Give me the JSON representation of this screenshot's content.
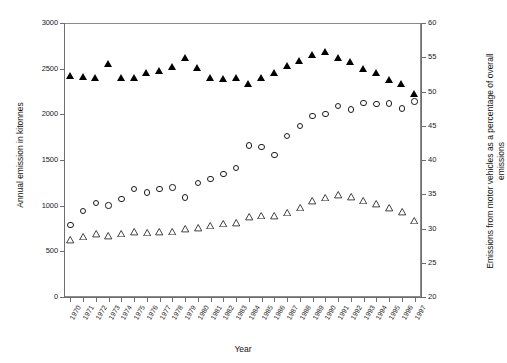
{
  "figure": {
    "title": "",
    "x_axis_title": "Year",
    "y_left_title": "Annual emission in kitonnes",
    "y_right_title": "Emissions from motor vehicles as a percentage of overall emissions"
  },
  "chart_data": {
    "type": "scatter",
    "title": "",
    "xlabel": "Year",
    "ylabel": "Annual emission in kitonnes",
    "y2label": "Emissions from motor vehicles as a percentage of overall emissions",
    "grid": false,
    "legend": "none",
    "xlim": [
      1970,
      1997
    ],
    "ylim": [
      0,
      3000
    ],
    "y2lim": [
      20,
      60
    ],
    "y_ticks": [
      0,
      500,
      1000,
      1500,
      2000,
      2500,
      3000
    ],
    "y2_ticks": [
      20,
      25,
      30,
      35,
      40,
      45,
      50,
      55,
      60
    ],
    "categories": [
      "1970",
      "1971",
      "1972",
      "1973",
      "1974",
      "1975",
      "1976",
      "1977",
      "1978",
      "1979",
      "1980",
      "1981",
      "1982",
      "1983",
      "1984",
      "1985",
      "1986",
      "1987",
      "1988",
      "1989",
      "1990",
      "1991",
      "1992",
      "1993",
      "1994",
      "1995",
      "1996",
      "1997"
    ],
    "series": [
      {
        "name": "Total annual emission (filled triangle)",
        "marker": "filled-triangle",
        "axis": "left",
        "values": [
          2420,
          2415,
          2400,
          2550,
          2395,
          2400,
          2450,
          2475,
          2525,
          2620,
          2505,
          2405,
          2390,
          2395,
          2330,
          2400,
          2450,
          2530,
          2590,
          2650,
          2680,
          2620,
          2570,
          2500,
          2450,
          2380,
          2330,
          2230
        ]
      },
      {
        "name": "Motor vehicle emission (open circle)",
        "marker": "open-circle",
        "axis": "left",
        "values": [
          790,
          940,
          1030,
          1000,
          1075,
          1180,
          1145,
          1185,
          1200,
          1090,
          1250,
          1290,
          1345,
          1415,
          1660,
          1640,
          1555,
          1760,
          1870,
          1985,
          2005,
          2090,
          2055,
          2125,
          2110,
          2120,
          2065,
          2140
        ]
      },
      {
        "name": "Motor vehicles as percentage of overall emissions (open triangle)",
        "marker": "open-triangle",
        "axis": "right",
        "values": [
          28.3,
          28.8,
          29.2,
          28.9,
          29.3,
          29.5,
          29.4,
          29.5,
          29.6,
          29.9,
          30.1,
          30.4,
          30.7,
          30.8,
          31.7,
          31.9,
          31.8,
          32.3,
          33.1,
          34.0,
          34.5,
          34.9,
          34.6,
          34.1,
          33.6,
          33.0,
          32.4,
          31.2
        ]
      }
    ]
  }
}
